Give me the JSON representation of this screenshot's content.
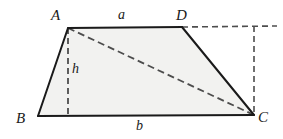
{
  "figure": {
    "type": "geometry-diagram",
    "shape": "trapezoid",
    "background_color": "#ffffff",
    "fill_color": "#f2f2f0",
    "stroke_color": "#1a1a1a",
    "dash_color": "#4d4d4d",
    "stroke_width": 2,
    "dash_width": 1.6,
    "dash_pattern": "6 4",
    "vertices": {
      "A": {
        "label": "A",
        "x": 68,
        "y": 28
      },
      "B": {
        "label": "B",
        "x": 38,
        "y": 116
      },
      "C": {
        "label": "C",
        "x": 254,
        "y": 115
      },
      "D": {
        "label": "D",
        "x": 182,
        "y": 27
      }
    },
    "side_labels": {
      "top": {
        "label": "a",
        "x": 118,
        "y": 8
      },
      "bottom": {
        "label": "b",
        "x": 136,
        "y": 119
      },
      "height": {
        "label": "h",
        "x": 72,
        "y": 62
      }
    },
    "solid_segments": [
      {
        "name": "side-AD",
        "x1": 68,
        "y1": 28,
        "x2": 182,
        "y2": 27
      },
      {
        "name": "side-DC",
        "x1": 182,
        "y1": 27,
        "x2": 254,
        "y2": 115
      },
      {
        "name": "side-CB",
        "x1": 254,
        "y1": 115,
        "x2": 38,
        "y2": 116
      },
      {
        "name": "side-BA",
        "x1": 38,
        "y1": 116,
        "x2": 68,
        "y2": 28
      }
    ],
    "dashed_segments": [
      {
        "name": "height-AF",
        "x1": 68,
        "y1": 28,
        "x2": 68,
        "y2": 115
      },
      {
        "name": "diagonal-AC",
        "x1": 68,
        "y1": 28,
        "x2": 254,
        "y2": 115
      },
      {
        "name": "extension-D-right",
        "x1": 182,
        "y1": 27,
        "x2": 277,
        "y2": 26
      },
      {
        "name": "extension-C-up",
        "x1": 254,
        "y1": 26,
        "x2": 254,
        "y2": 115
      }
    ],
    "fill_polygon": "68,28 182,27 254,115 38,116"
  }
}
